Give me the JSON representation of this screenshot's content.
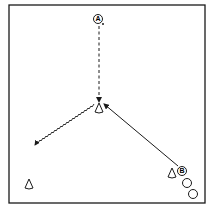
{
  "diagram": {
    "type": "drill-diagram",
    "players": [
      {
        "id": "A",
        "label": "A",
        "x": 98,
        "y": 19
      },
      {
        "id": "B",
        "label": "B",
        "x": 182,
        "y": 171
      }
    ],
    "extra_players": [
      {
        "x": 187,
        "y": 183
      },
      {
        "x": 193,
        "y": 194
      }
    ],
    "cones": [
      {
        "name": "center",
        "x": 99,
        "y": 108
      },
      {
        "name": "left",
        "x": 29,
        "y": 184
      },
      {
        "name": "right",
        "x": 172,
        "y": 173
      }
    ],
    "paths": [
      {
        "type": "run-dashed",
        "from": "A",
        "to": "center-cone"
      },
      {
        "type": "pass-solid",
        "from": "B",
        "to": "center"
      },
      {
        "type": "dribble-wavy",
        "from": "center",
        "to": "left-cone"
      }
    ],
    "colors": {
      "line": "#1a1a1a",
      "background": "#ffffff"
    }
  }
}
